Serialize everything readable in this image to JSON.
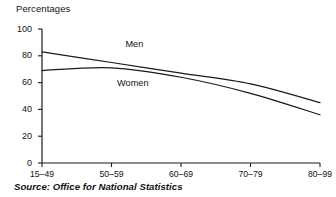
{
  "chart_data": {
    "type": "line",
    "title": "",
    "ylabel": "Percentages",
    "xlabel": "",
    "categories": [
      "15–49",
      "50–59",
      "60–69",
      "70–79",
      "80–99"
    ],
    "ytick_labels": [
      "0",
      "20",
      "40",
      "60",
      "80",
      "100"
    ],
    "yticks": [
      0,
      20,
      40,
      60,
      80,
      100
    ],
    "ylim": [
      0,
      100
    ],
    "grid": false,
    "legend_position": "inline-labels",
    "series": [
      {
        "name": "Men",
        "label": "Men",
        "color": "#1a1a1a",
        "values": [
          83,
          75,
          67,
          59,
          45
        ]
      },
      {
        "name": "Women",
        "label": "Women",
        "color": "#1a1a1a",
        "values": [
          69,
          71,
          64,
          52,
          36
        ]
      }
    ],
    "annotations": [
      {
        "text": "Men",
        "x_frac": 0.3,
        "y_value": 88
      },
      {
        "text": "Women",
        "x_frac": 0.27,
        "y_value": 59
      }
    ],
    "source": "Source: Office for National Statistics"
  },
  "axis": {
    "axis_color": "#1a1a1a",
    "line_color": "#1a1a1a"
  }
}
